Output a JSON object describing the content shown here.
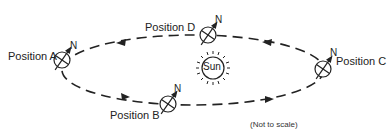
{
  "diagram": {
    "type": "earth-orbit",
    "sun_label": "Sun",
    "north_label": "N",
    "note": "(Not to scale)",
    "positions": [
      {
        "id": "A",
        "label": "Position A"
      },
      {
        "id": "B",
        "label": "Position B"
      },
      {
        "id": "C",
        "label": "Position C"
      },
      {
        "id": "D",
        "label": "Position D"
      }
    ],
    "orbit_direction": "counterclockwise",
    "colors": {
      "line": "#222222",
      "background": "#ffffff"
    }
  }
}
